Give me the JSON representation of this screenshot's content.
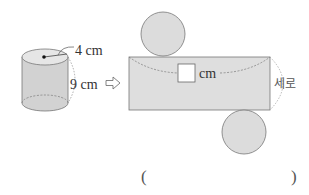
{
  "cylinder": {
    "radius_label": "4 cm",
    "height_label": "9 cm",
    "fill_color": "#d4d4d4",
    "top_fill_color": "#e4e4e4"
  },
  "arrow": {
    "symbol": "⇨",
    "icon": "right-arrow-icon"
  },
  "net": {
    "rect_fill_color": "#dedede",
    "circle_fill_color": "#dcdcdc",
    "width_unit_label": "cm",
    "width_blank": "",
    "height_label": "세로"
  },
  "answer": {
    "open_paren": "(",
    "close_paren": ")",
    "value": ""
  }
}
